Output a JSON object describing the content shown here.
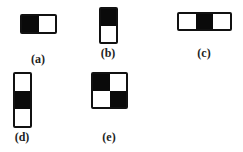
{
  "figures": [
    {
      "id": "a",
      "label": "(a)",
      "rows": 1,
      "cols": 2,
      "cells": [
        "black",
        "white"
      ]
    },
    {
      "id": "b",
      "label": "(b)",
      "rows": 2,
      "cols": 1,
      "cells": [
        "black",
        "white"
      ]
    },
    {
      "id": "c",
      "label": "(c)",
      "rows": 1,
      "cols": 3,
      "cells": [
        "white",
        "black",
        "white"
      ]
    },
    {
      "id": "d",
      "label": "(d)",
      "rows": 3,
      "cols": 1,
      "cells": [
        "white",
        "black",
        "white"
      ]
    },
    {
      "id": "e",
      "label": "(e)",
      "rows": 2,
      "cols": 2,
      "cells": [
        "black",
        "white",
        "white",
        "black"
      ]
    }
  ],
  "colors": {
    "black": "#0a0a0a",
    "white": "#ffffff",
    "border": "#111111"
  }
}
